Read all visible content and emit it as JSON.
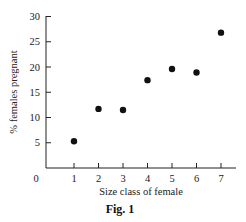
{
  "chart_data": {
    "type": "scatter",
    "title": "",
    "caption": "Fig. 1",
    "xlabel": "Size class of female",
    "ylabel": "% females pregnant",
    "x": [
      1,
      2,
      3,
      4,
      5,
      6,
      7
    ],
    "y": [
      5.3,
      11.7,
      11.5,
      17.4,
      19.6,
      18.9,
      26.8
    ],
    "series": [
      {
        "name": "% females pregnant",
        "x": [
          1,
          2,
          3,
          4,
          5,
          6,
          7
        ],
        "values": [
          5.3,
          11.7,
          11.5,
          17.4,
          19.6,
          18.9,
          26.8
        ]
      }
    ],
    "xticks": [
      "1",
      "2",
      "3",
      "4",
      "5",
      "6",
      "7"
    ],
    "yticks": [
      "5",
      "10",
      "15",
      "20",
      "25",
      "30"
    ],
    "origin_label": "0",
    "xlim": [
      0,
      7.6
    ],
    "ylim": [
      0,
      30
    ],
    "grid": false,
    "legend": "none",
    "marker_color": "#111111"
  }
}
